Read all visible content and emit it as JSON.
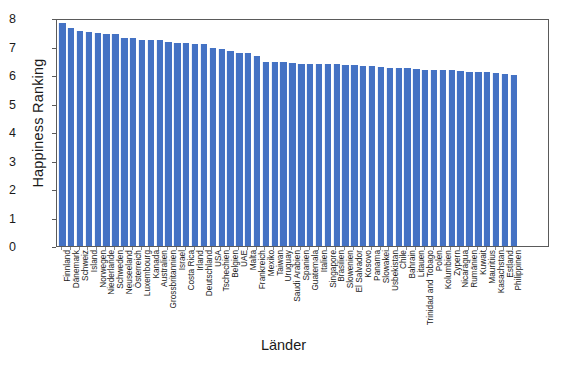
{
  "chart_data": {
    "type": "bar",
    "title": "",
    "xlabel": "Länder",
    "ylabel": "Happiness Ranking",
    "ylim": [
      0,
      8
    ],
    "yticks": [
      0,
      1,
      2,
      3,
      4,
      5,
      6,
      7,
      8
    ],
    "grid": false,
    "legend": null,
    "bar_color": "#4472c4",
    "categories": [
      "Finnland",
      "Dänemark",
      "Schweiz",
      "Island",
      "Norwegen",
      "Niederlande",
      "Schweden",
      "Neuseeland",
      "Österreich",
      "Luxembourg",
      "Kanada",
      "Australien",
      "Grossbritannien",
      "Israel",
      "Costa Rica",
      "Irland",
      "Deutschland",
      "USA",
      "Tschechien",
      "Belgien",
      "UAE",
      "Malta",
      "Frankreich",
      "Mexiko",
      "Taiwan",
      "Uruguay",
      "Saudi Arabien",
      "Spanien",
      "Guatemala",
      "Italien",
      "Singapore",
      "Brasilien",
      "Slowenien",
      "El Salvador",
      "Kosovo",
      "Panama",
      "Slowakei",
      "Usbekistan",
      "Chile",
      "Bahrain",
      "Litauen",
      "Trinidad and Tobago",
      "Polen",
      "Kolumbien",
      "Zypern",
      "Nicaragua",
      "Rumänien",
      "Kuwait",
      "Mauritius",
      "Kasachstan",
      "Estland",
      "Philippinen"
    ],
    "values": [
      7.81,
      7.65,
      7.56,
      7.5,
      7.49,
      7.45,
      7.44,
      7.3,
      7.29,
      7.24,
      7.23,
      7.22,
      7.16,
      7.13,
      7.12,
      7.09,
      7.08,
      6.94,
      6.91,
      6.86,
      6.79,
      6.77,
      6.66,
      6.47,
      6.46,
      6.44,
      6.41,
      6.4,
      6.4,
      6.39,
      6.38,
      6.38,
      6.36,
      6.35,
      6.32,
      6.31,
      6.28,
      6.26,
      6.23,
      6.23,
      6.22,
      6.19,
      6.19,
      6.16,
      6.16,
      6.14,
      6.12,
      6.1,
      6.1,
      6.06,
      6.02,
      6.01
    ]
  }
}
